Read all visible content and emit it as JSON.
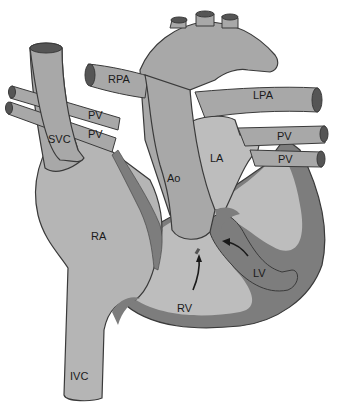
{
  "diagram": {
    "type": "anatomical-heart",
    "colors": {
      "background": "#ffffff",
      "vessel_fill": "#a8a8a8",
      "chamber_fill": "#bdbdbd",
      "myocardium_fill": "#7d7d7d",
      "outline": "#3a3a3a",
      "lumen": "#555555"
    },
    "labels": {
      "rpa": "RPA",
      "lpa": "LPA",
      "pv_left_upper": "PV",
      "pv_left_lower": "PV",
      "pv_right_upper": "PV",
      "pv_right_lower": "PV",
      "svc": "SVC",
      "ao": "Ao",
      "la": "LA",
      "ra": "RA",
      "lv": "LV",
      "rv": "RV",
      "ivc": "IVC"
    },
    "arrows": [
      {
        "name": "rv-to-aorta-arrow",
        "from": "RV",
        "to": "Ao"
      },
      {
        "name": "lv-to-aorta-arrow",
        "from": "LV",
        "to": "Ao"
      }
    ]
  }
}
